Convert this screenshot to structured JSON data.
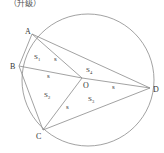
{
  "header": {
    "text": "（升级）"
  },
  "figure": {
    "circle": {
      "cx": 88,
      "cy": 80,
      "r": 66
    },
    "points": {
      "A": {
        "label": "A",
        "x": 32,
        "y": 34,
        "lx": 25,
        "ly": 34
      },
      "B": {
        "label": "B",
        "x": 19,
        "y": 66,
        "lx": 10,
        "ly": 69
      },
      "C": {
        "label": "C",
        "x": 43,
        "y": 130,
        "lx": 36,
        "ly": 139
      },
      "D": {
        "label": "D",
        "x": 150,
        "y": 88,
        "lx": 153,
        "ly": 92
      },
      "O": {
        "label": "O",
        "x": 82,
        "y": 78,
        "lx": 83,
        "ly": 88
      }
    },
    "region_labels": {
      "S1": {
        "main": "S",
        "sub": "1",
        "x": 34,
        "y": 59
      },
      "S2": {
        "main": "S",
        "sub": "2",
        "x": 44,
        "y": 97
      },
      "S3": {
        "main": "S",
        "sub": "3",
        "x": 88,
        "y": 101
      },
      "S4": {
        "main": "S",
        "sub": "4",
        "x": 86,
        "y": 72
      }
    },
    "segment_labels": [
      {
        "text": "s",
        "x": 54,
        "y": 61
      },
      {
        "text": "s",
        "x": 47,
        "y": 78
      },
      {
        "text": "s",
        "x": 112,
        "y": 89
      },
      {
        "text": "s",
        "x": 66,
        "y": 109
      }
    ],
    "line_color": "#8a8a8a"
  }
}
